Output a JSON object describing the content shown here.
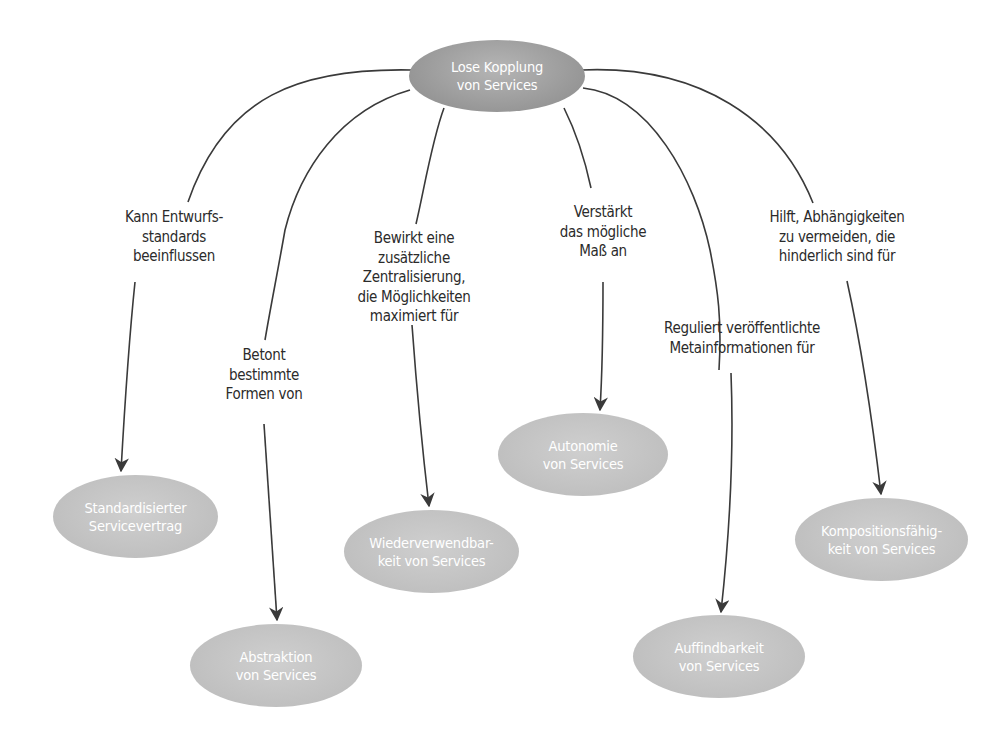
{
  "diagram": {
    "colors": {
      "center_node": "#9b9b9b",
      "child_node": "#c4c4c4",
      "node_text": "#ffffff",
      "edge": "#3a3a3a",
      "label_text": "#2b2b2b",
      "background": "#ffffff"
    },
    "center": {
      "line1": "Lose Kopplung",
      "line2": "von Services"
    },
    "nodes": [
      {
        "id": "standardisierter-servicevertrag",
        "line1": "Standardisierter",
        "line2": "Servicevertrag"
      },
      {
        "id": "abstraktion",
        "line1": "Abstraktion",
        "line2": "von Services"
      },
      {
        "id": "wiederverwendbarkeit",
        "line1": "Wiederverwendbar-",
        "line2": "keit von Services"
      },
      {
        "id": "autonomie",
        "line1": "Autonomie",
        "line2": "von Services"
      },
      {
        "id": "auffindbarkeit",
        "line1": "Auffindbarkeit",
        "line2": "von Services"
      },
      {
        "id": "kompositionsfaehigkeit",
        "line1": "Kompositionsfähig-",
        "line2": "keit von Services"
      }
    ],
    "edges": [
      {
        "to": "standardisierter-servicevertrag",
        "lines": [
          "Kann Entwurfs-",
          "standards",
          "beeinflussen"
        ]
      },
      {
        "to": "abstraktion",
        "lines": [
          "Betont",
          "bestimmte",
          "Formen von"
        ]
      },
      {
        "to": "wiederverwendbarkeit",
        "lines": [
          "Bewirkt eine",
          "zusätzliche",
          "Zentralisierung,",
          "die Möglichkeiten",
          "maximiert für"
        ]
      },
      {
        "to": "autonomie",
        "lines": [
          "Verstärkt",
          "das mögliche",
          "Maß an"
        ]
      },
      {
        "to": "auffindbarkeit",
        "lines": [
          "Reguliert veröffentlichte",
          "Metainformationen für"
        ]
      },
      {
        "to": "kompositionsfaehigkeit",
        "lines": [
          "Hilft, Abhängigkeiten",
          "zu vermeiden, die",
          "hinderlich sind für"
        ]
      }
    ]
  }
}
